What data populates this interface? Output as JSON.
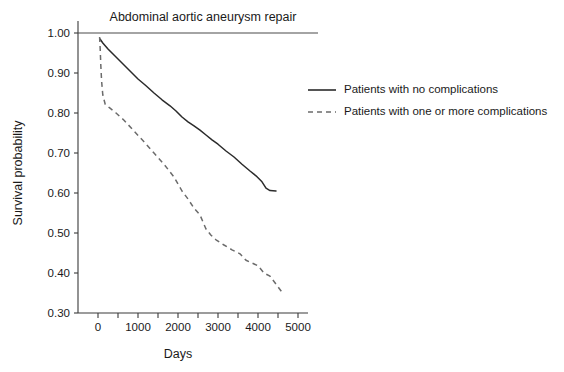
{
  "chart_data": {
    "type": "line",
    "title": "Abdominal aortic aneurysm repair",
    "xlabel": "Days",
    "ylabel": "Survival probability",
    "xlim": [
      -250,
      5250
    ],
    "ylim": [
      0.3,
      1.0
    ],
    "grid": false,
    "legend_position": "right",
    "xticks": [
      0,
      1000,
      2000,
      3000,
      4000,
      5000
    ],
    "xtick_labels": [
      "0",
      "1000",
      "2000",
      "3000",
      "4000",
      "5000"
    ],
    "xminor_ticks": [
      500,
      1500,
      2500,
      3500,
      4500
    ],
    "yticks": [
      0.3,
      0.4,
      0.5,
      0.6,
      0.7,
      0.8,
      0.9,
      1.0
    ],
    "ytick_labels": [
      "0.30",
      "0.40",
      "0.50",
      "0.60",
      "0.70",
      "0.80",
      "0.90",
      "1.00"
    ],
    "series": [
      {
        "name": "Patients with no complications",
        "style": "solid",
        "color": "#2b2b2b",
        "x": [
          50,
          120,
          250,
          400,
          600,
          800,
          1000,
          1200,
          1400,
          1600,
          1800,
          1950,
          2100,
          2250,
          2400,
          2550,
          2700,
          2850,
          3000,
          3200,
          3400,
          3600,
          3800,
          3950,
          4100,
          4200,
          4300,
          4450
        ],
        "y": [
          0.985,
          0.975,
          0.96,
          0.945,
          0.925,
          0.905,
          0.885,
          0.868,
          0.85,
          0.833,
          0.818,
          0.805,
          0.79,
          0.778,
          0.768,
          0.757,
          0.745,
          0.733,
          0.722,
          0.705,
          0.69,
          0.672,
          0.655,
          0.643,
          0.628,
          0.612,
          0.606,
          0.605
        ]
      },
      {
        "name": "Patients with one or more complications",
        "style": "dashed",
        "color": "#6b6b6b",
        "x": [
          40,
          55,
          70,
          90,
          120,
          180,
          300,
          450,
          650,
          900,
          1150,
          1400,
          1650,
          1900,
          2100,
          2250,
          2400,
          2550,
          2700,
          2820,
          2950,
          3150,
          3350,
          3550,
          3700,
          3850,
          4000,
          4150,
          4300,
          4450,
          4600
        ],
        "y": [
          0.99,
          0.96,
          0.92,
          0.88,
          0.845,
          0.822,
          0.812,
          0.8,
          0.782,
          0.755,
          0.728,
          0.7,
          0.672,
          0.64,
          0.605,
          0.585,
          0.562,
          0.545,
          0.51,
          0.495,
          0.483,
          0.47,
          0.458,
          0.448,
          0.432,
          0.425,
          0.418,
          0.4,
          0.392,
          0.372,
          0.352
        ]
      }
    ]
  },
  "legend": {
    "entries": [
      {
        "label": "Patients with no complications",
        "style": "solid"
      },
      {
        "label": "Patients with one or more complications",
        "style": "dashed"
      }
    ]
  }
}
